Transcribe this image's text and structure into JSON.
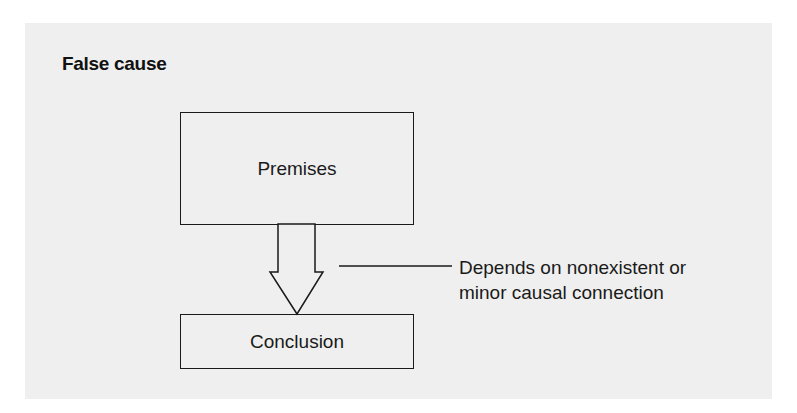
{
  "diagram": {
    "title": "False cause",
    "nodes": [
      {
        "id": "premises",
        "label": "Premises"
      },
      {
        "id": "conclusion",
        "label": "Conclusion"
      }
    ],
    "edges": [
      {
        "from": "premises",
        "to": "conclusion",
        "style": "hollow-block-arrow"
      }
    ],
    "annotation": {
      "target": "arrow",
      "lines": [
        "Depends on nonexistent or",
        "minor causal connection"
      ]
    },
    "colors": {
      "panel_background": "#efefef",
      "stroke": "#1a1a1a",
      "text": "#1a1a1a"
    }
  }
}
